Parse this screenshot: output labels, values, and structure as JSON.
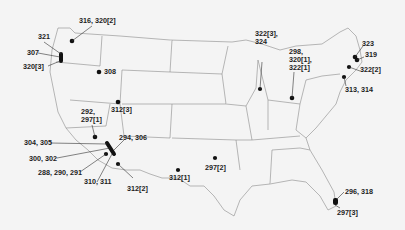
{
  "map": {
    "region": "Contiguous United States",
    "markers": [
      {
        "id": "m1",
        "label": "316, 320[2]",
        "x": 72,
        "y": 41
      },
      {
        "id": "m2",
        "label": "321",
        "x": 62,
        "y": 54
      },
      {
        "id": "m3",
        "label": "307",
        "x": 61,
        "y": 57
      },
      {
        "id": "m4",
        "label": "320[3]",
        "x": 61,
        "y": 61
      },
      {
        "id": "m5",
        "label": "308",
        "x": 99,
        "y": 72
      },
      {
        "id": "m6",
        "label": "312[3]",
        "x": 118,
        "y": 102
      },
      {
        "id": "m7",
        "label": "292,\n297[1]",
        "x": 95,
        "y": 137
      },
      {
        "id": "m8",
        "label": "304, 305",
        "x": 107,
        "y": 145
      },
      {
        "id": "m9",
        "label": "294, 306",
        "x": 112,
        "y": 150
      },
      {
        "id": "m10",
        "label": "300, 302",
        "x": 105,
        "y": 154
      },
      {
        "id": "m11",
        "label": "288, 290, 291",
        "x": 110,
        "y": 158
      },
      {
        "id": "m12",
        "label": "310, 311",
        "x": 106,
        "y": 154
      },
      {
        "id": "m13",
        "label": "312[2]",
        "x": 118,
        "y": 164
      },
      {
        "id": "m14",
        "label": "312[1]",
        "x": 178,
        "y": 170
      },
      {
        "id": "m15",
        "label": "297[2]",
        "x": 215,
        "y": 158
      },
      {
        "id": "m16",
        "label": "322[3],\n324",
        "x": 260,
        "y": 89
      },
      {
        "id": "m17",
        "label": "298,\n320[1],\n322[1]",
        "x": 292,
        "y": 98
      },
      {
        "id": "m18",
        "label": "323",
        "x": 354,
        "y": 56
      },
      {
        "id": "m19",
        "label": "319",
        "x": 357,
        "y": 59
      },
      {
        "id": "m20",
        "label": "322[2]",
        "x": 348,
        "y": 67
      },
      {
        "id": "m21",
        "label": "313, 314",
        "x": 344,
        "y": 76
      },
      {
        "id": "m22",
        "label": "296, 318",
        "x": 336,
        "y": 200
      },
      {
        "id": "m23",
        "label": "297[3]",
        "x": 336,
        "y": 202
      }
    ]
  }
}
